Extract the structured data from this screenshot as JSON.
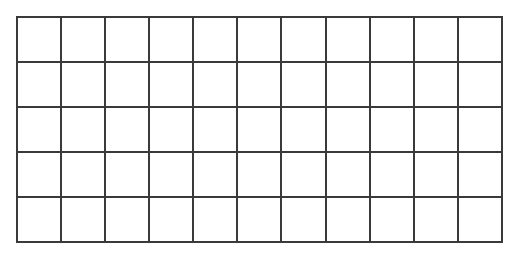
{
  "grid": {
    "rows": 5,
    "columns": 11,
    "line_color": "#3a3a3a",
    "background": "#ffffff"
  }
}
